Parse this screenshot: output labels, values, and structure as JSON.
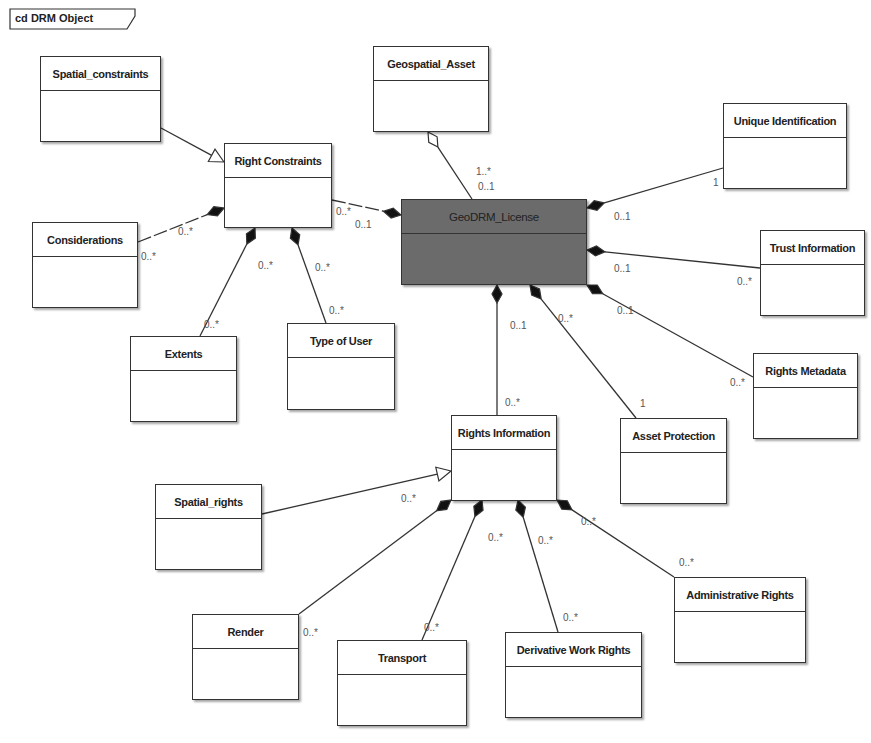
{
  "frame": {
    "label": "cd DRM Object"
  },
  "classes": [
    {
      "id": "spatial_constraints",
      "name": "Spatial_constraints",
      "x": 40,
      "y": 56,
      "w": 121,
      "h": 86
    },
    {
      "id": "right_constraints",
      "name": "Right Constraints",
      "x": 224,
      "y": 143,
      "w": 108,
      "h": 85
    },
    {
      "id": "geospatial_asset",
      "name": "Geospatial_Asset",
      "x": 373,
      "y": 46,
      "w": 116,
      "h": 86
    },
    {
      "id": "geodrm_license",
      "name": "GeoDRM_License",
      "x": 401,
      "y": 199,
      "w": 186,
      "h": 86,
      "dark": true
    },
    {
      "id": "unique_identification",
      "name": "Unique Identification",
      "x": 723,
      "y": 103,
      "w": 124,
      "h": 86
    },
    {
      "id": "trust_information",
      "name": "Trust Information",
      "x": 760,
      "y": 230,
      "w": 105,
      "h": 86
    },
    {
      "id": "considerations",
      "name": "Considerations",
      "x": 32,
      "y": 222,
      "w": 106,
      "h": 86
    },
    {
      "id": "extents",
      "name": "Extents",
      "x": 130,
      "y": 336,
      "w": 107,
      "h": 86
    },
    {
      "id": "type_of_user",
      "name": "Type of User",
      "x": 287,
      "y": 323,
      "w": 108,
      "h": 87
    },
    {
      "id": "rights_metadata",
      "name": "Rights Metadata",
      "x": 753,
      "y": 353,
      "w": 105,
      "h": 86
    },
    {
      "id": "rights_information",
      "name": "Rights Information",
      "x": 451,
      "y": 415,
      "w": 106,
      "h": 86
    },
    {
      "id": "asset_protection",
      "name": "Asset Protection",
      "x": 620,
      "y": 418,
      "w": 107,
      "h": 86
    },
    {
      "id": "spatial_rights",
      "name": "Spatial_rights",
      "x": 155,
      "y": 484,
      "w": 107,
      "h": 86
    },
    {
      "id": "render",
      "name": "Render",
      "x": 192,
      "y": 614,
      "w": 107,
      "h": 86
    },
    {
      "id": "transport",
      "name": "Transport",
      "x": 337,
      "y": 640,
      "w": 130,
      "h": 86
    },
    {
      "id": "derivative_work_rights",
      "name": "Derivative Work Rights",
      "x": 505,
      "y": 632,
      "w": 137,
      "h": 86
    },
    {
      "id": "administrative_rights",
      "name": "Administrative Rights",
      "x": 674,
      "y": 577,
      "w": 132,
      "h": 86
    }
  ],
  "links": [
    {
      "type": "generalization",
      "from": [
        161,
        128
      ],
      "to": [
        224,
        162
      ]
    },
    {
      "type": "aggregation",
      "from": [
        472,
        199
      ],
      "to": [
        428,
        132
      ]
    },
    {
      "type": "composition",
      "from": [
        332,
        200
      ],
      "to": [
        401,
        215
      ],
      "dashed": true
    },
    {
      "type": "composition",
      "from": [
        723,
        168
      ],
      "to": [
        587,
        208
      ]
    },
    {
      "type": "composition",
      "from": [
        760,
        268
      ],
      "to": [
        587,
        250
      ]
    },
    {
      "type": "composition",
      "from": [
        753,
        377
      ],
      "to": [
        587,
        285
      ]
    },
    {
      "type": "composition",
      "from": [
        497,
        415
      ],
      "to": [
        497,
        285
      ]
    },
    {
      "type": "composition",
      "from": [
        636,
        418
      ],
      "to": [
        530,
        285
      ]
    },
    {
      "type": "composition",
      "from": [
        138,
        242
      ],
      "to": [
        224,
        208
      ],
      "dashed": true
    },
    {
      "type": "composition",
      "from": [
        200,
        336
      ],
      "to": [
        255,
        228
      ]
    },
    {
      "type": "composition",
      "from": [
        326,
        323
      ],
      "to": [
        292,
        228
      ]
    },
    {
      "type": "generalization",
      "from": [
        262,
        514
      ],
      "to": [
        451,
        471
      ]
    },
    {
      "type": "composition",
      "from": [
        299,
        614
      ],
      "to": [
        451,
        500
      ]
    },
    {
      "type": "composition",
      "from": [
        422,
        640
      ],
      "to": [
        482,
        500
      ]
    },
    {
      "type": "composition",
      "from": [
        558,
        632
      ],
      "to": [
        518,
        500
      ]
    },
    {
      "type": "composition",
      "from": [
        674,
        577
      ],
      "to": [
        557,
        500
      ]
    }
  ],
  "multiplicities": [
    {
      "text": "1..*",
      "x": 476,
      "y": 166
    },
    {
      "text": "0..1",
      "x": 478,
      "y": 181
    },
    {
      "text": "0..*",
      "x": 336,
      "y": 206
    },
    {
      "text": "0..1",
      "x": 355,
      "y": 219
    },
    {
      "text": "0..*",
      "x": 178,
      "y": 226
    },
    {
      "text": "0..*",
      "x": 141,
      "y": 251
    },
    {
      "text": "0..*",
      "x": 258,
      "y": 260
    },
    {
      "text": "0..*",
      "x": 315,
      "y": 262
    },
    {
      "text": "0..*",
      "x": 204,
      "y": 319
    },
    {
      "text": "0..*",
      "x": 329,
      "y": 305
    },
    {
      "text": "1",
      "x": 713,
      "y": 177
    },
    {
      "text": "0..1",
      "x": 614,
      "y": 211
    },
    {
      "text": "0..1",
      "x": 614,
      "y": 263
    },
    {
      "text": "0..*",
      "x": 737,
      "y": 276
    },
    {
      "text": "0..1",
      "x": 617,
      "y": 305
    },
    {
      "text": "0..*",
      "x": 730,
      "y": 377
    },
    {
      "text": "0..1",
      "x": 510,
      "y": 320
    },
    {
      "text": "0..*",
      "x": 558,
      "y": 313
    },
    {
      "text": "0..*",
      "x": 505,
      "y": 397
    },
    {
      "text": "1",
      "x": 640,
      "y": 398
    },
    {
      "text": "0..*",
      "x": 401,
      "y": 493
    },
    {
      "text": "0..*",
      "x": 488,
      "y": 532
    },
    {
      "text": "0..*",
      "x": 538,
      "y": 535
    },
    {
      "text": "0..*",
      "x": 581,
      "y": 516
    },
    {
      "text": "0..*",
      "x": 679,
      "y": 557
    },
    {
      "text": "0..*",
      "x": 303,
      "y": 627
    },
    {
      "text": "0..*",
      "x": 424,
      "y": 622
    },
    {
      "text": "0..*",
      "x": 563,
      "y": 612
    }
  ],
  "colors": {
    "stroke": "#333333",
    "dark_fill": "#6b6b6b",
    "label": "#555555"
  }
}
